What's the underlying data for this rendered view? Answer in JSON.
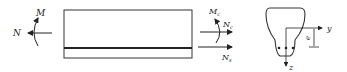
{
  "diagram": {
    "beam": {
      "left_forces": {
        "moment_label": "M",
        "axial_label": "N"
      },
      "right_forces": {
        "moment_label": "M",
        "moment_sub": "c",
        "axial_top_label": "N",
        "axial_top_sub": "c",
        "axial_bottom_label": "N",
        "axial_bottom_sub": "s"
      }
    },
    "section": {
      "y_axis_label": "y",
      "z_axis_label": "z",
      "eccentricity_label": "e",
      "rebar_count": 3
    },
    "colors": {
      "stroke": "#222222",
      "background": "#ffffff"
    }
  }
}
